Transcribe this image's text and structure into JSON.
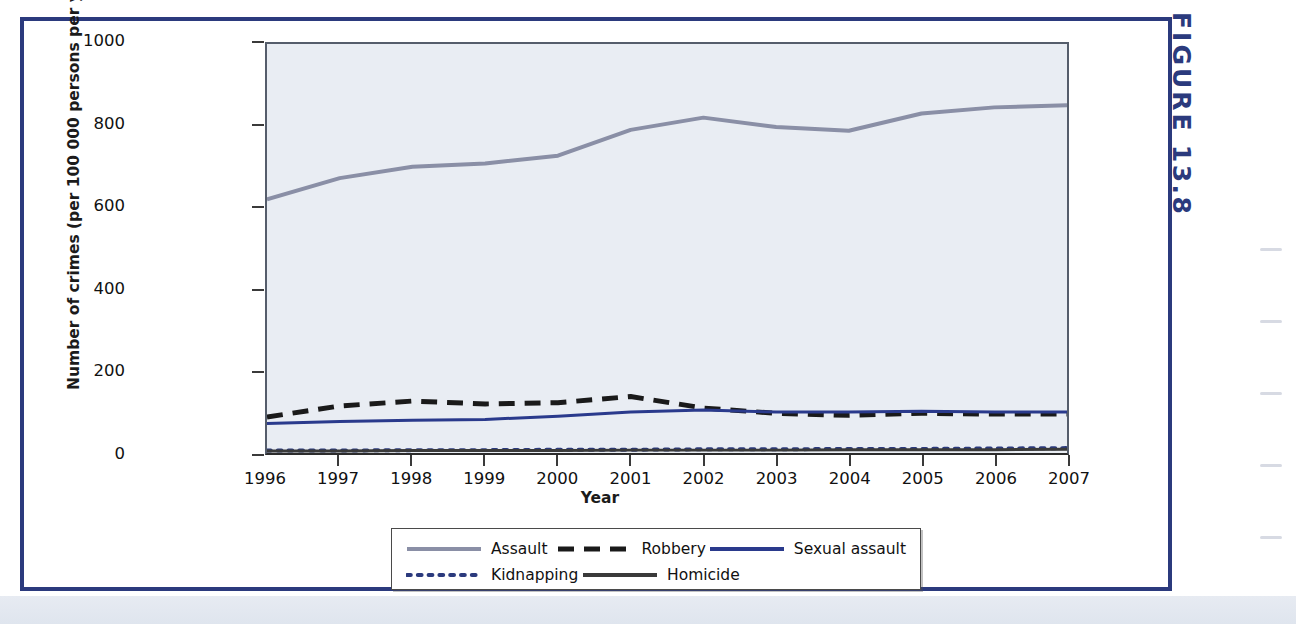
{
  "figure": {
    "caption_word": "FIGURE",
    "caption_number": "13.8"
  },
  "chart_data": {
    "type": "line",
    "title": "",
    "xlabel": "Year",
    "ylabel": "Number of crimes (per 100 000 persons per year)",
    "x": [
      1996,
      1997,
      1998,
      1999,
      2000,
      2001,
      2002,
      2003,
      2004,
      2005,
      2006,
      2007
    ],
    "xtick_labels": [
      "1996",
      "1997",
      "1998",
      "1999",
      "2000",
      "2001",
      "2002",
      "2003",
      "2004",
      "2005",
      "2006",
      "2007"
    ],
    "ytick_labels": [
      "0",
      "200",
      "400",
      "600",
      "800",
      "1000"
    ],
    "ytick_values": [
      0,
      200,
      400,
      600,
      800,
      1000
    ],
    "ylim": [
      0,
      1000
    ],
    "xlim": [
      1996,
      2007
    ],
    "grid": false,
    "legend_position": "bottom",
    "plot_background": "#e9edf3",
    "series": [
      {
        "name": "Assault",
        "style": "solid",
        "color": "#8a8fa6",
        "width": 4,
        "values": [
          620,
          672,
          700,
          708,
          727,
          790,
          820,
          797,
          788,
          830,
          845,
          850
        ]
      },
      {
        "name": "Robbery",
        "style": "dashed",
        "color": "#1a1a1a",
        "width": 5,
        "values": [
          88,
          115,
          127,
          120,
          123,
          138,
          110,
          97,
          92,
          97,
          95,
          95
        ]
      },
      {
        "name": "Sexual assault",
        "style": "solid",
        "color": "#2a3a8c",
        "width": 3,
        "values": [
          72,
          77,
          80,
          82,
          90,
          100,
          105,
          100,
          100,
          102,
          100,
          100
        ]
      },
      {
        "name": "Kidnapping",
        "style": "dotted",
        "color": "#2b3a7d",
        "width": 4,
        "values": [
          6,
          6,
          7,
          7,
          8,
          8,
          9,
          9,
          10,
          10,
          11,
          12
        ]
      },
      {
        "name": "Homicide",
        "style": "solid",
        "color": "#3a3a3a",
        "width": 3,
        "values": [
          5,
          5,
          6,
          6,
          6,
          7,
          7,
          7,
          8,
          8,
          8,
          9
        ]
      }
    ]
  },
  "colors": {
    "frame_navy": "#2b3a7d",
    "plot_bg": "#e9edf3",
    "axis": "#3a3a3a"
  }
}
